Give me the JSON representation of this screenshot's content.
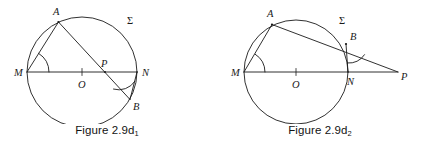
{
  "page": {
    "background_color": "#ffffff",
    "stroke_color": "#1a1a1a",
    "label_color": "#1a1a1a",
    "width": 427,
    "height": 148
  },
  "figures": [
    {
      "id": "figure-2-9d1",
      "caption_prefix": "Figure 2.9d",
      "caption_subscript": "1",
      "caption_full": "Figure 2.9d1",
      "description": "Circle Sigma with diameter MN through center O; chord AB crosses MN at interior point P; inscribed angles marked at M and at B",
      "circle": {
        "cx": 82,
        "cy": 72,
        "r": 55,
        "label": "Σ",
        "label_x": 127,
        "label_y": 24
      },
      "center": {
        "name": "O",
        "x": 82,
        "y": 72,
        "label_x": 79,
        "label_y": 87,
        "tick": true
      },
      "points": [
        {
          "name": "A",
          "x": 58.5,
          "y": 22.0,
          "label_x": 53,
          "label_y": 15,
          "on_circle": true
        },
        {
          "name": "M",
          "x": 27.0,
          "y": 72.0,
          "label_x": 14,
          "label_y": 76,
          "on_circle": true
        },
        {
          "name": "N",
          "x": 137.0,
          "y": 72.0,
          "label_x": 142,
          "label_y": 76,
          "on_circle": true
        },
        {
          "name": "B",
          "x": 130.0,
          "y": 99.5,
          "label_x": 133,
          "label_y": 110,
          "on_circle": true
        },
        {
          "name": "P",
          "x": 105.0,
          "y": 72.0,
          "label_x": 101,
          "label_y": 66,
          "on_circle": false
        }
      ],
      "segments": [
        {
          "name": "chord-MN",
          "from": "M",
          "to": "N"
        },
        {
          "name": "chord-AB",
          "from": "A",
          "to": "B"
        },
        {
          "name": "chord-MA",
          "from": "M",
          "to": "A"
        },
        {
          "name": "chord-BN",
          "from": "B",
          "to": "N"
        }
      ],
      "angle_marks": [
        {
          "name": "angle-AMN",
          "vertex": "M",
          "radius": 22
        },
        {
          "name": "angle-ABN",
          "vertex": "B",
          "radius": 19
        }
      ]
    },
    {
      "id": "figure-2-9d2",
      "caption_prefix": "Figure 2.9d",
      "caption_subscript": "2",
      "caption_full": "Figure 2.9d2",
      "description": "Circle Sigma with diameter MN through center O; line AB extended meets line MN extended at exterior point P; inscribed angles marked at M and at B",
      "circle": {
        "cx": 83,
        "cy": 72,
        "r": 52,
        "label": "Σ",
        "label_x": 126,
        "label_y": 24
      },
      "center": {
        "name": "O",
        "x": 83,
        "y": 72,
        "label_x": 80,
        "label_y": 87,
        "tick": true
      },
      "points": [
        {
          "name": "A",
          "x": 59.0,
          "y": 24.5,
          "label_x": 54,
          "label_y": 16,
          "on_circle": true
        },
        {
          "name": "M",
          "x": 31.0,
          "y": 72.0,
          "label_x": 18,
          "label_y": 76,
          "on_circle": true
        },
        {
          "name": "N",
          "x": 135.0,
          "y": 72.0,
          "label_x": 135,
          "label_y": 84,
          "on_circle": true
        },
        {
          "name": "B",
          "x": 133.0,
          "y": 44.0,
          "label_x": 136,
          "label_y": 39,
          "on_circle": true
        },
        {
          "name": "P",
          "x": 185.0,
          "y": 72.0,
          "label_x": 187,
          "label_y": 80,
          "on_circle": false
        }
      ],
      "segments": [
        {
          "name": "chord-MN-extended-to-P",
          "from": "M",
          "to": "P"
        },
        {
          "name": "line-A-through-B-to-P",
          "from": "A",
          "to": "P"
        },
        {
          "name": "chord-MA",
          "from": "M",
          "to": "A"
        },
        {
          "name": "chord-BN",
          "from": "B",
          "to": "N"
        }
      ],
      "angle_marks": [
        {
          "name": "angle-AMN",
          "vertex": "M",
          "radius": 21
        },
        {
          "name": "angle-NBP",
          "vertex": "B",
          "radius": 19
        }
      ]
    }
  ]
}
